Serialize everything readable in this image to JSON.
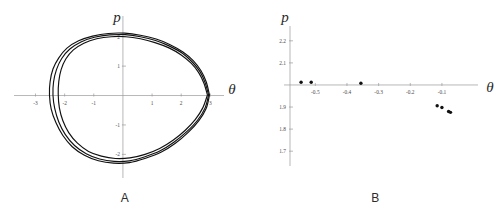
{
  "figure": {
    "panel_a": {
      "caption": "A",
      "ylabel": "p",
      "xlabel": "θ"
    },
    "panel_b": {
      "caption": "B",
      "ylabel": "p",
      "xlabel": "θ"
    }
  },
  "chart_data": [
    {
      "type": "line",
      "panel": "A",
      "title": "",
      "xlabel": "θ",
      "ylabel": "p",
      "xlim": [
        -3.6,
        3.4
      ],
      "ylim": [
        -2.6,
        2.5
      ],
      "xticks": [
        -3,
        -2,
        -1,
        1,
        2,
        3
      ],
      "yticks": [
        1,
        2,
        -1,
        -2
      ],
      "xtick_labels": [
        "-3",
        "-2",
        "-1",
        "1",
        "2",
        "3"
      ],
      "ytick_labels": [
        "1",
        "2",
        "-1",
        "-2"
      ],
      "grid": false,
      "legend": "none",
      "description": "Closed phase-space orbit, several nearly overlapping loops forming a teardrop/egg shape with a cusp-like right tip.",
      "series": [
        {
          "name": "orbit-1",
          "points": [
            [
              2.9,
              0.02
            ],
            [
              2.78,
              0.42
            ],
            [
              2.6,
              0.78
            ],
            [
              2.34,
              1.1
            ],
            [
              2.0,
              1.38
            ],
            [
              1.58,
              1.62
            ],
            [
              1.1,
              1.8
            ],
            [
              0.6,
              1.93
            ],
            [
              0.1,
              2.0
            ],
            [
              -0.4,
              2.0
            ],
            [
              -0.9,
              1.93
            ],
            [
              -1.34,
              1.78
            ],
            [
              -1.7,
              1.55
            ],
            [
              -1.96,
              1.24
            ],
            [
              -2.12,
              0.88
            ],
            [
              -2.2,
              0.48
            ],
            [
              -2.22,
              0.04
            ],
            [
              -2.18,
              -0.42
            ],
            [
              -2.06,
              -0.86
            ],
            [
              -1.86,
              -1.26
            ],
            [
              -1.56,
              -1.62
            ],
            [
              -1.18,
              -1.9
            ],
            [
              -0.74,
              -2.06
            ],
            [
              -0.26,
              -2.14
            ],
            [
              0.24,
              -2.12
            ],
            [
              0.76,
              -2.0
            ],
            [
              1.26,
              -1.8
            ],
            [
              1.72,
              -1.52
            ],
            [
              2.14,
              -1.18
            ],
            [
              2.48,
              -0.82
            ],
            [
              2.74,
              -0.42
            ],
            [
              2.9,
              0.02
            ]
          ]
        },
        {
          "name": "orbit-2",
          "points": [
            [
              2.94,
              0.02
            ],
            [
              2.82,
              0.44
            ],
            [
              2.64,
              0.82
            ],
            [
              2.38,
              1.14
            ],
            [
              2.04,
              1.44
            ],
            [
              1.6,
              1.68
            ],
            [
              1.12,
              1.87
            ],
            [
              0.6,
              2.0
            ],
            [
              0.08,
              2.07
            ],
            [
              -0.46,
              2.06
            ],
            [
              -0.98,
              1.98
            ],
            [
              -1.44,
              1.82
            ],
            [
              -1.82,
              1.58
            ],
            [
              -2.1,
              1.26
            ],
            [
              -2.28,
              0.88
            ],
            [
              -2.38,
              0.46
            ],
            [
              -2.4,
              0.02
            ],
            [
              -2.34,
              -0.44
            ],
            [
              -2.2,
              -0.9
            ],
            [
              -1.98,
              -1.32
            ],
            [
              -1.66,
              -1.7
            ],
            [
              -1.26,
              -1.98
            ],
            [
              -0.8,
              -2.16
            ],
            [
              -0.3,
              -2.24
            ],
            [
              0.22,
              -2.22
            ],
            [
              0.76,
              -2.08
            ],
            [
              1.28,
              -1.88
            ],
            [
              1.76,
              -1.58
            ],
            [
              2.2,
              -1.22
            ],
            [
              2.56,
              -0.84
            ],
            [
              2.82,
              -0.42
            ],
            [
              2.94,
              0.02
            ]
          ]
        },
        {
          "name": "orbit-3",
          "points": [
            [
              2.97,
              0.02
            ],
            [
              2.86,
              0.46
            ],
            [
              2.68,
              0.84
            ],
            [
              2.42,
              1.18
            ],
            [
              2.06,
              1.48
            ],
            [
              1.62,
              1.73
            ],
            [
              1.14,
              1.92
            ],
            [
              0.6,
              2.05
            ],
            [
              0.06,
              2.12
            ],
            [
              -0.5,
              2.11
            ],
            [
              -1.04,
              2.02
            ],
            [
              -1.52,
              1.86
            ],
            [
              -1.92,
              1.61
            ],
            [
              -2.2,
              1.28
            ],
            [
              -2.4,
              0.9
            ],
            [
              -2.5,
              0.46
            ],
            [
              -2.52,
              0.02
            ],
            [
              -2.46,
              -0.46
            ],
            [
              -2.3,
              -0.92
            ],
            [
              -2.06,
              -1.36
            ],
            [
              -1.74,
              -1.74
            ],
            [
              -1.32,
              -2.03
            ],
            [
              -0.84,
              -2.22
            ],
            [
              -0.32,
              -2.3
            ],
            [
              0.22,
              -2.28
            ],
            [
              0.78,
              -2.13
            ],
            [
              1.32,
              -1.92
            ],
            [
              1.8,
              -1.62
            ],
            [
              2.24,
              -1.25
            ],
            [
              2.6,
              -0.86
            ],
            [
              2.86,
              -0.43
            ],
            [
              2.97,
              0.02
            ]
          ]
        }
      ]
    },
    {
      "type": "scatter",
      "panel": "B",
      "title": "",
      "xlabel": "θ",
      "ylabel": "p",
      "xlim": [
        -0.58,
        -0.005
      ],
      "ylim": [
        1.66,
        2.24
      ],
      "xticks": [
        -0.5,
        -0.4,
        -0.3,
        -0.2,
        -0.1
      ],
      "yticks": [
        2.2,
        2.1,
        1.9,
        1.8,
        1.7
      ],
      "xtick_labels": [
        "-0.5",
        "-0.4",
        "-0.3",
        "-0.2",
        "-0.1"
      ],
      "ytick_labels": [
        "2.2",
        "2.1",
        "1.9",
        "1.8",
        "1.7"
      ],
      "grid": false,
      "legend": "none",
      "description": "Poincaré-section points: a few near p = 2.0 at the left, then a descending cluster near θ = -0.1 around p = 1.88-1.91.",
      "x": [
        -0.545,
        -0.513,
        -0.356,
        -0.115,
        -0.1,
        -0.079,
        -0.073
      ],
      "y": [
        2.012,
        2.012,
        2.008,
        1.906,
        1.898,
        1.88,
        1.876
      ]
    }
  ]
}
